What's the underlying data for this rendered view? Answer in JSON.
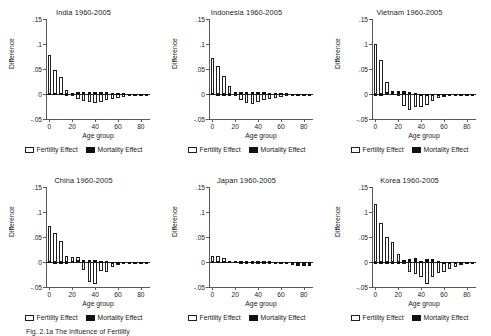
{
  "figure": {
    "caption": "Fig. 2.1a  The Influence of Fertility",
    "axis": {
      "ylabel": "Difference",
      "xlabel": "Age group",
      "yticks": [
        -0.05,
        0,
        0.05,
        0.1,
        0.15
      ],
      "yticklabels": [
        "-.05",
        "0",
        ".05",
        ".1",
        ".15"
      ],
      "xticks": [
        0,
        20,
        40,
        60,
        80
      ],
      "xticklabels": [
        "0",
        "20",
        "40",
        "60",
        "80"
      ],
      "ylim": [
        -0.05,
        0.15
      ],
      "xlim": [
        -3,
        88
      ]
    },
    "legend": {
      "fertility_label": "Fertility Effect",
      "mortality_label": "Mortality Effect",
      "fertility_color": "#ffffff",
      "mortality_color": "#111111",
      "position": "below-axis-center"
    }
  },
  "chart_data": [
    {
      "type": "bar",
      "title": "India 1960-2005",
      "xlabel": "Age group",
      "ylabel": "Difference",
      "ylim": [
        -0.05,
        0.15
      ],
      "xlim": [
        -3,
        88
      ],
      "categories": [
        0,
        5,
        10,
        15,
        20,
        25,
        30,
        35,
        40,
        45,
        50,
        55,
        60,
        65,
        70,
        75,
        80,
        85
      ],
      "series": [
        {
          "name": "Fertility Effect",
          "values": [
            0.078,
            0.049,
            0.034,
            0.008,
            -0.004,
            -0.01,
            -0.013,
            -0.015,
            -0.017,
            -0.015,
            -0.012,
            -0.009,
            -0.007,
            -0.005,
            -0.004,
            -0.003,
            -0.002,
            -0.001
          ]
        },
        {
          "name": "Mortality Effect",
          "values": [
            0.002,
            0.002,
            0.002,
            0.001,
            0.003,
            0.004,
            0.005,
            0.005,
            0.005,
            0.004,
            0.004,
            0.003,
            0.002,
            0.002,
            0.001,
            0.001,
            0.001,
            0.0
          ]
        }
      ]
    },
    {
      "type": "bar",
      "title": "Indonesia 1960-2005",
      "xlabel": "Age group",
      "ylabel": "Difference",
      "ylim": [
        -0.05,
        0.15
      ],
      "xlim": [
        -3,
        88
      ],
      "categories": [
        0,
        5,
        10,
        15,
        20,
        25,
        30,
        35,
        40,
        45,
        50,
        55,
        60,
        65,
        70,
        75,
        80,
        85
      ],
      "series": [
        {
          "name": "Fertility Effect",
          "values": [
            0.073,
            0.057,
            0.036,
            0.017,
            -0.002,
            -0.012,
            -0.018,
            -0.02,
            -0.015,
            -0.012,
            -0.01,
            -0.008,
            -0.006,
            -0.004,
            -0.003,
            -0.002,
            -0.001,
            -0.001
          ]
        },
        {
          "name": "Mortality Effect",
          "values": [
            0.002,
            -0.002,
            0.001,
            0.001,
            0.004,
            0.005,
            0.005,
            0.005,
            0.005,
            0.004,
            0.003,
            0.003,
            0.002,
            0.002,
            0.001,
            0.001,
            0.0,
            0.0
          ]
        }
      ]
    },
    {
      "type": "bar",
      "title": "Vietnam 1960-2005",
      "xlabel": "Age group",
      "ylabel": "Difference",
      "ylim": [
        -0.05,
        0.15
      ],
      "xlim": [
        -3,
        88
      ],
      "categories": [
        0,
        5,
        10,
        15,
        20,
        25,
        30,
        35,
        40,
        45,
        50,
        55,
        60,
        65,
        70,
        75,
        80,
        85
      ],
      "series": [
        {
          "name": "Fertility Effect",
          "values": [
            0.101,
            0.069,
            0.025,
            0.003,
            -0.001,
            -0.024,
            -0.032,
            -0.026,
            -0.026,
            -0.021,
            -0.013,
            -0.008,
            -0.006,
            -0.004,
            -0.003,
            -0.002,
            -0.001,
            -0.001
          ]
        },
        {
          "name": "Mortality Effect",
          "values": [
            0.001,
            0.0,
            0.004,
            0.006,
            0.006,
            0.006,
            0.005,
            0.002,
            0.0,
            -0.003,
            -0.004,
            -0.004,
            -0.004,
            -0.004,
            -0.003,
            -0.002,
            -0.001,
            0.0
          ]
        }
      ]
    },
    {
      "type": "bar",
      "title": "China 1960-2005",
      "xlabel": "Age group",
      "ylabel": "Difference",
      "ylim": [
        -0.05,
        0.15
      ],
      "xlim": [
        -3,
        88
      ],
      "categories": [
        0,
        5,
        10,
        15,
        20,
        25,
        30,
        35,
        40,
        45,
        50,
        55,
        60,
        65,
        70,
        75,
        80,
        85
      ],
      "series": [
        {
          "name": "Fertility Effect",
          "values": [
            0.072,
            0.058,
            0.043,
            0.012,
            0.01,
            0.01,
            -0.015,
            -0.04,
            -0.044,
            -0.018,
            -0.019,
            -0.009,
            -0.005,
            -0.004,
            -0.002,
            -0.002,
            -0.001,
            -0.001
          ]
        },
        {
          "name": "Mortality Effect",
          "values": [
            0.002,
            0.001,
            0.001,
            0.001,
            0.002,
            0.004,
            0.005,
            0.005,
            0.004,
            0.003,
            0.002,
            -0.003,
            -0.004,
            -0.003,
            -0.002,
            -0.002,
            -0.001,
            0.0
          ]
        }
      ]
    },
    {
      "type": "bar",
      "title": "Japan 1960-2005",
      "xlabel": "Age group",
      "ylabel": "Difference",
      "ylim": [
        -0.05,
        0.15
      ],
      "xlim": [
        -3,
        88
      ],
      "categories": [
        0,
        5,
        10,
        15,
        20,
        25,
        30,
        35,
        40,
        45,
        50,
        55,
        60,
        65,
        70,
        75,
        80,
        85
      ],
      "series": [
        {
          "name": "Fertility Effect",
          "values": [
            0.013,
            0.013,
            0.008,
            0.003,
            0.002,
            0.001,
            -0.003,
            -0.003,
            -0.003,
            -0.003,
            -0.003,
            -0.003,
            -0.003,
            -0.002,
            -0.001,
            -0.001,
            -0.001,
            0.0
          ]
        },
        {
          "name": "Mortality Effect",
          "values": [
            0.002,
            0.002,
            0.002,
            0.002,
            0.002,
            0.002,
            0.002,
            0.002,
            0.002,
            0.002,
            0.002,
            0.001,
            0.0,
            -0.003,
            -0.005,
            -0.007,
            -0.008,
            -0.008
          ]
        }
      ]
    },
    {
      "type": "bar",
      "title": "Korea 1960-2005",
      "xlabel": "Age group",
      "ylabel": "Difference",
      "ylim": [
        -0.05,
        0.15
      ],
      "xlim": [
        -3,
        88
      ],
      "categories": [
        0,
        5,
        10,
        15,
        20,
        25,
        30,
        35,
        40,
        45,
        50,
        55,
        60,
        65,
        70,
        75,
        80,
        85
      ],
      "series": [
        {
          "name": "Fertility Effect",
          "values": [
            0.117,
            0.078,
            0.051,
            0.04,
            0.017,
            -0.003,
            -0.02,
            -0.024,
            -0.029,
            -0.044,
            -0.029,
            -0.022,
            -0.019,
            -0.014,
            -0.01,
            -0.006,
            -0.003,
            -0.001
          ]
        },
        {
          "name": "Mortality Effect",
          "values": [
            0.001,
            0.001,
            0.001,
            0.001,
            0.001,
            0.005,
            0.007,
            0.008,
            0.003,
            0.006,
            0.006,
            0.003,
            -0.002,
            -0.003,
            -0.003,
            -0.002,
            -0.001,
            0.0
          ]
        }
      ]
    }
  ]
}
